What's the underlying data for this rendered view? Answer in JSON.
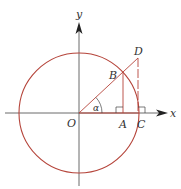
{
  "diagram": {
    "axes": {
      "x_label": "x",
      "y_label": "y"
    },
    "points": {
      "O": {
        "label": "O"
      },
      "A": {
        "label": "A"
      },
      "B": {
        "label": "B"
      },
      "C": {
        "label": "C"
      },
      "D": {
        "label": "D"
      }
    },
    "angle_label": "α",
    "colors": {
      "circle": "#b5443a",
      "axis": "#333333",
      "segment": "#b5443a"
    }
  }
}
